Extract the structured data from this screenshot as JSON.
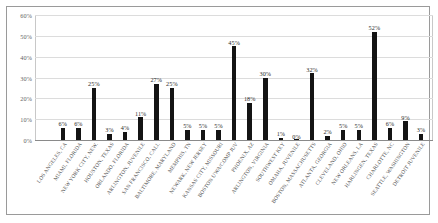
{
  "chart_data": {
    "type": "bar",
    "title": "",
    "xlabel": "",
    "ylabel": "",
    "ylim": [
      0,
      60
    ],
    "ytick_labels": [
      "0%",
      "10%",
      "20%",
      "30%",
      "40%",
      "50%",
      "60%"
    ],
    "ytick_values": [
      0,
      10,
      20,
      30,
      40,
      50,
      60
    ],
    "grid": true,
    "legend": "none",
    "value_suffix": "%",
    "categories": [
      "LOS ANGELES, CA",
      "MIAMI, FLORIDA",
      "NEW YORK CITY, NEW.",
      "HOUSTON, TEXAS",
      "ORLANDO, FLORIDA",
      "ARLINGTON, JUVENILE",
      "SAN FRANCISCO, CALI.",
      "BALTIMORE, MARYLAND",
      "MEMPHIS, TN",
      "NEWARK, NEW JERSEY",
      "KANSAS CITY, MISSOURI",
      "BOSTON UWA/COMP JUV",
      "PHOENIX, AZ",
      "ARLINGTON, VIRGINIA",
      "SOUTHWEST KEY",
      "OMAHA, JUVENILE",
      "BOSTON, MASSACHUSETTS",
      "ATLANTA, GEORGIA",
      "CLEVELAND, OHIO",
      "NEW ORLEANS, LA",
      "HARLINGEN, TEXAS",
      "CHARLOTTE, NC",
      "SEATTLE, WASHINGTON",
      "DETROIT JUVENILE"
    ],
    "values": [
      6,
      6,
      25,
      3,
      4,
      11,
      27,
      25,
      5,
      5,
      5,
      45,
      18,
      30,
      1,
      0,
      32,
      2,
      5,
      5,
      52,
      6,
      9,
      3
    ],
    "value_labels": [
      "6%",
      "6%",
      "25%",
      "3%",
      "4%",
      "11%",
      "27%",
      "25%",
      "5%",
      "5%",
      "5%",
      "45%",
      "18%",
      "30%",
      "1%",
      "0%",
      "32%",
      "2%",
      "5%",
      "5%",
      "52%",
      "6%",
      "9%",
      "3%"
    ],
    "colors": {
      "bar": "#141414",
      "gridline": "#dcdcdc",
      "axis": "#8a8a8a",
      "tick_text": "#636363",
      "label_text": "#4a4a4a",
      "frame": "#9a9a9a",
      "background": "#ffffff"
    }
  }
}
